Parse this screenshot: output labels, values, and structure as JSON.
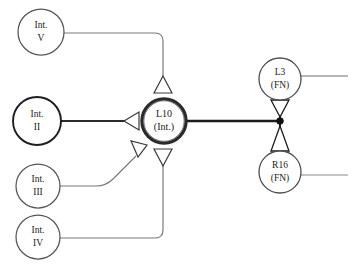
{
  "diagram": {
    "type": "node-link-graph",
    "background_color": "#ffffff",
    "line_color_thin": "#6b6b6b",
    "line_color_thick": "#1b1b1b",
    "node_stroke_color": "#4a4a4a",
    "node_stroke_color_bold": "#1b1b1b",
    "node_fill": "#ffffff",
    "junction_dot_color": "#111111",
    "nodes": [
      {
        "id": "int-v",
        "line1": "Int.",
        "line2": "V",
        "cx": 41,
        "cy": 32,
        "r": 23,
        "emphasis": "normal"
      },
      {
        "id": "int-ii",
        "line1": "Int.",
        "line2": "II",
        "cx": 37,
        "cy": 121,
        "r": 24,
        "emphasis": "bold"
      },
      {
        "id": "int-iii",
        "line1": "Int.",
        "line2": "III",
        "cx": 38,
        "cy": 186,
        "r": 22,
        "emphasis": "normal"
      },
      {
        "id": "int-iv",
        "line1": "Int.",
        "line2": "IV",
        "cx": 38,
        "cy": 237,
        "r": 22,
        "emphasis": "normal"
      },
      {
        "id": "l10",
        "line1": "L10",
        "line2": "(Int.)",
        "cx": 164,
        "cy": 121,
        "r": 22,
        "emphasis": "heavy"
      },
      {
        "id": "l3",
        "line1": "L3",
        "line2": "(FN)",
        "cx": 280,
        "cy": 79,
        "r": 21,
        "emphasis": "normal"
      },
      {
        "id": "r16",
        "line1": "R16",
        "line2": "(FN)",
        "cx": 280,
        "cy": 172,
        "r": 21,
        "emphasis": "normal"
      }
    ],
    "edges": [
      {
        "id": "edge-int-v-to-l10",
        "from": "int-v",
        "to": "l10",
        "weight": "thin",
        "arrow": "triangle-up"
      },
      {
        "id": "edge-int-ii-to-l10",
        "from": "int-ii",
        "to": "l10",
        "weight": "thick",
        "arrow": "triangle-left"
      },
      {
        "id": "edge-int-iii-to-l10",
        "from": "int-iii",
        "to": "l10",
        "weight": "thin",
        "arrow": "triangle-diagonal"
      },
      {
        "id": "edge-int-iv-to-l10",
        "from": "int-iv",
        "to": "l10",
        "weight": "thin",
        "arrow": "triangle-down"
      },
      {
        "id": "edge-l10-to-junction",
        "from": "l10",
        "to": "junction",
        "weight": "thick",
        "arrow": "none"
      },
      {
        "id": "edge-junction-to-l3",
        "from": "junction",
        "to": "l3",
        "weight": "thick",
        "arrow": "triangle-down"
      },
      {
        "id": "edge-junction-to-r16",
        "from": "junction",
        "to": "r16",
        "weight": "thick",
        "arrow": "triangle-up"
      },
      {
        "id": "edge-l3-stub",
        "from": "l3",
        "to": "off-canvas-right",
        "weight": "thin",
        "arrow": "none"
      },
      {
        "id": "edge-r16-stub",
        "from": "r16",
        "to": "off-canvas-right",
        "weight": "thin",
        "arrow": "none"
      }
    ],
    "junction": {
      "id": "junction-dot",
      "cx": 280,
      "cy": 121,
      "r": 3.2
    }
  }
}
